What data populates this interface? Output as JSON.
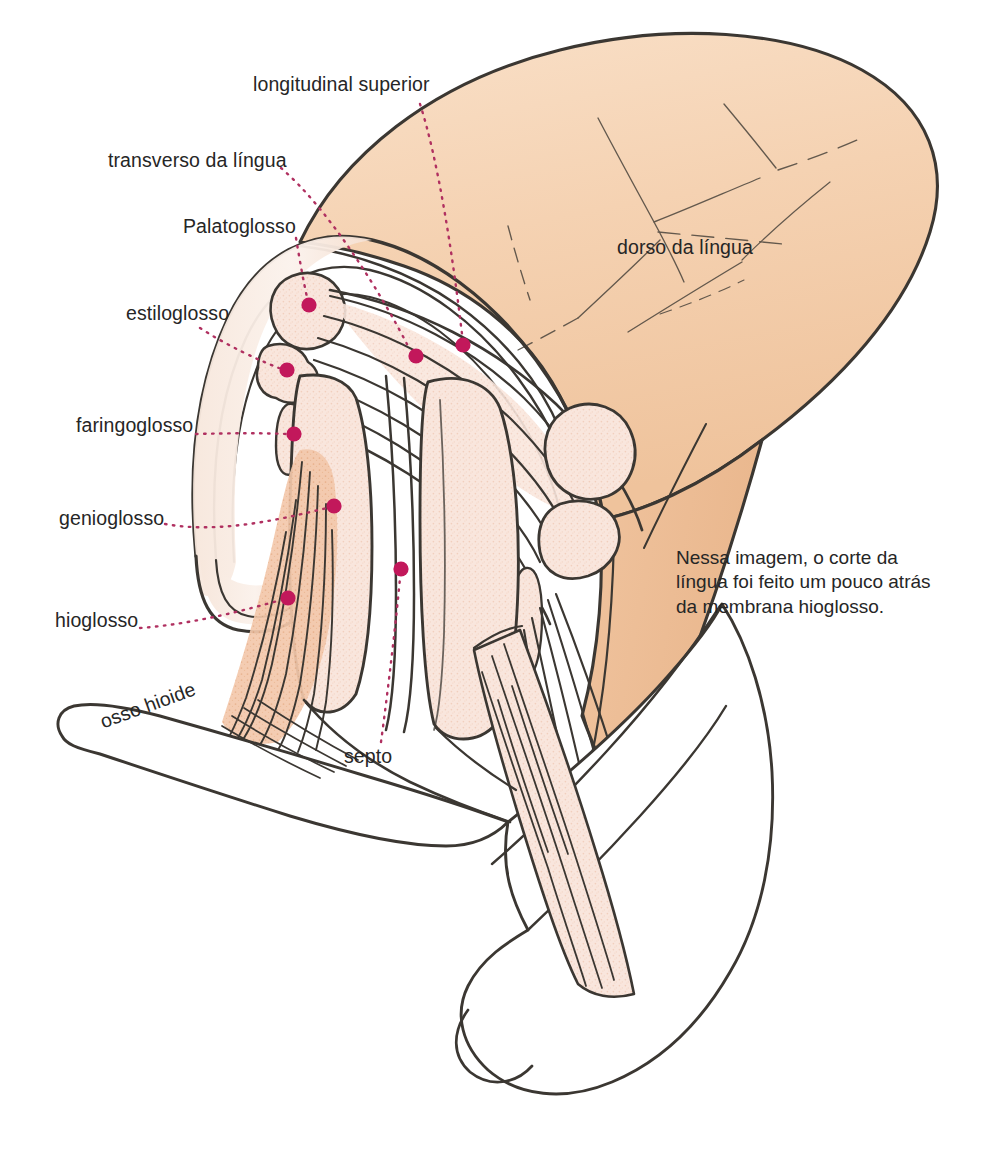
{
  "figure": {
    "title_text_present": false,
    "background_color": "#ffffff",
    "ink_color": "#3b3732",
    "marker_color": "#c2185b",
    "leader_color": "#b03060",
    "text_color": "#262626",
    "tongue_fill": "#f6d6b9",
    "tongue_fill_deep": "#eab489",
    "muscle_fill": "#f7e0d7",
    "muscle_fill_warm": "#e8a984",
    "bone_fill": "#ffffff",
    "width": 1005,
    "height": 1161
  },
  "labels": [
    {
      "id": "longitudinal-superior",
      "text": "longitudinal superior",
      "x": 253,
      "y": 84,
      "align": "left",
      "marker": {
        "x": 463,
        "y": 345
      }
    },
    {
      "id": "transverso-da-lingua",
      "text": "transverso da língua",
      "x": 108,
      "y": 160,
      "align": "left",
      "marker": {
        "x": 416,
        "y": 356
      }
    },
    {
      "id": "palatoglosso",
      "text": "Palatoglosso",
      "x": 183,
      "y": 226,
      "align": "left",
      "marker": {
        "x": 309,
        "y": 305
      }
    },
    {
      "id": "estiloglosso",
      "text": "estiloglosso",
      "x": 126,
      "y": 313,
      "align": "left",
      "marker": {
        "x": 287,
        "y": 370
      }
    },
    {
      "id": "faringoglosso",
      "text": "faringoglosso",
      "x": 76,
      "y": 425,
      "align": "left",
      "marker": {
        "x": 294,
        "y": 434
      }
    },
    {
      "id": "genioglosso",
      "text": "genioglosso",
      "x": 59,
      "y": 518,
      "align": "left",
      "marker": {
        "x": 334,
        "y": 506
      }
    },
    {
      "id": "hioglosso",
      "text": "hioglosso",
      "x": 55,
      "y": 620,
      "align": "left",
      "marker": {
        "x": 288,
        "y": 598
      }
    },
    {
      "id": "septo",
      "text": "septo",
      "x": 344,
      "y": 756,
      "align": "left",
      "marker": {
        "x": 401,
        "y": 569
      }
    },
    {
      "id": "dorso-da-lingua",
      "text": "dorso da língua",
      "x": 617,
      "y": 247,
      "align": "left",
      "marker": null
    },
    {
      "id": "osso-hioide",
      "text": "osso hioide",
      "x": 101,
      "y": 705,
      "align": "left",
      "marker": null,
      "rotated": true
    }
  ],
  "note": {
    "id": "section-note",
    "text": "Nessa imagem, o corte da\nlíngua foi feito um pouco atrás\nda membrana hioglosso.",
    "x": 676,
    "y": 546
  },
  "markers": [
    {
      "id": "marker-palatoglosso",
      "x": 309,
      "y": 305,
      "r": 7.5
    },
    {
      "id": "marker-estiloglosso",
      "x": 287,
      "y": 370,
      "r": 7.5
    },
    {
      "id": "marker-faringoglosso",
      "x": 294,
      "y": 434,
      "r": 7.5
    },
    {
      "id": "marker-genioglosso",
      "x": 334,
      "y": 506,
      "r": 7.5
    },
    {
      "id": "marker-hioglosso",
      "x": 288,
      "y": 598,
      "r": 7.5
    },
    {
      "id": "marker-transverso-da-lingua",
      "x": 416,
      "y": 356,
      "r": 7.5
    },
    {
      "id": "marker-longitudinal-superior",
      "x": 463,
      "y": 345,
      "r": 7.5
    },
    {
      "id": "marker-septo",
      "x": 401,
      "y": 569,
      "r": 7.5
    }
  ],
  "leaders": [
    {
      "id": "leader-longitudinal-superior",
      "d": "M 420 104 C 438 160 452 250 462 334"
    },
    {
      "id": "leader-transverso-da-lingua",
      "d": "M 281 168 C 330 210 382 295 409 348"
    },
    {
      "id": "leader-palatoglosso",
      "d": "M 296 238 C 300 262 304 284 307 297"
    },
    {
      "id": "leader-estiloglosso",
      "d": "M 200 328 C 228 346 258 360 279 368"
    },
    {
      "id": "leader-faringoglosso",
      "d": "M 196 434 C 232 433 266 433 286 434"
    },
    {
      "id": "leader-genioglosso",
      "d": "M 165 524 C 220 534 282 519 327 508"
    },
    {
      "id": "leader-hioglosso",
      "d": "M 140 628 C 196 624 252 608 281 600"
    },
    {
      "id": "leader-septo",
      "d": "M 381 742 C 388 690 396 622 400 578"
    }
  ]
}
